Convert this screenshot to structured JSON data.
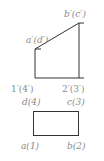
{
  "diagram": {
    "type": "orthographic-projection",
    "front_view": {
      "labels": {
        "top_left": "a′(d′)",
        "top_right": "b′(c′)",
        "bottom_left": "1′(4′)",
        "bottom_right": "2′(3′)"
      },
      "points": {
        "a_d": [
          35,
          49
        ],
        "b_c": [
          79,
          23
        ],
        "p1_4": [
          35,
          78
        ],
        "p2_3": [
          79,
          78
        ]
      }
    },
    "top_view": {
      "labels": {
        "top_left": "d(4)",
        "top_right": "c(3)",
        "bottom_left": "a(1)",
        "bottom_right": "b(2)"
      },
      "rect": {
        "x": 33,
        "y": 111,
        "width": 46,
        "height": 25
      }
    },
    "line_color": "#333333",
    "label_color": "#8a8a8a"
  }
}
